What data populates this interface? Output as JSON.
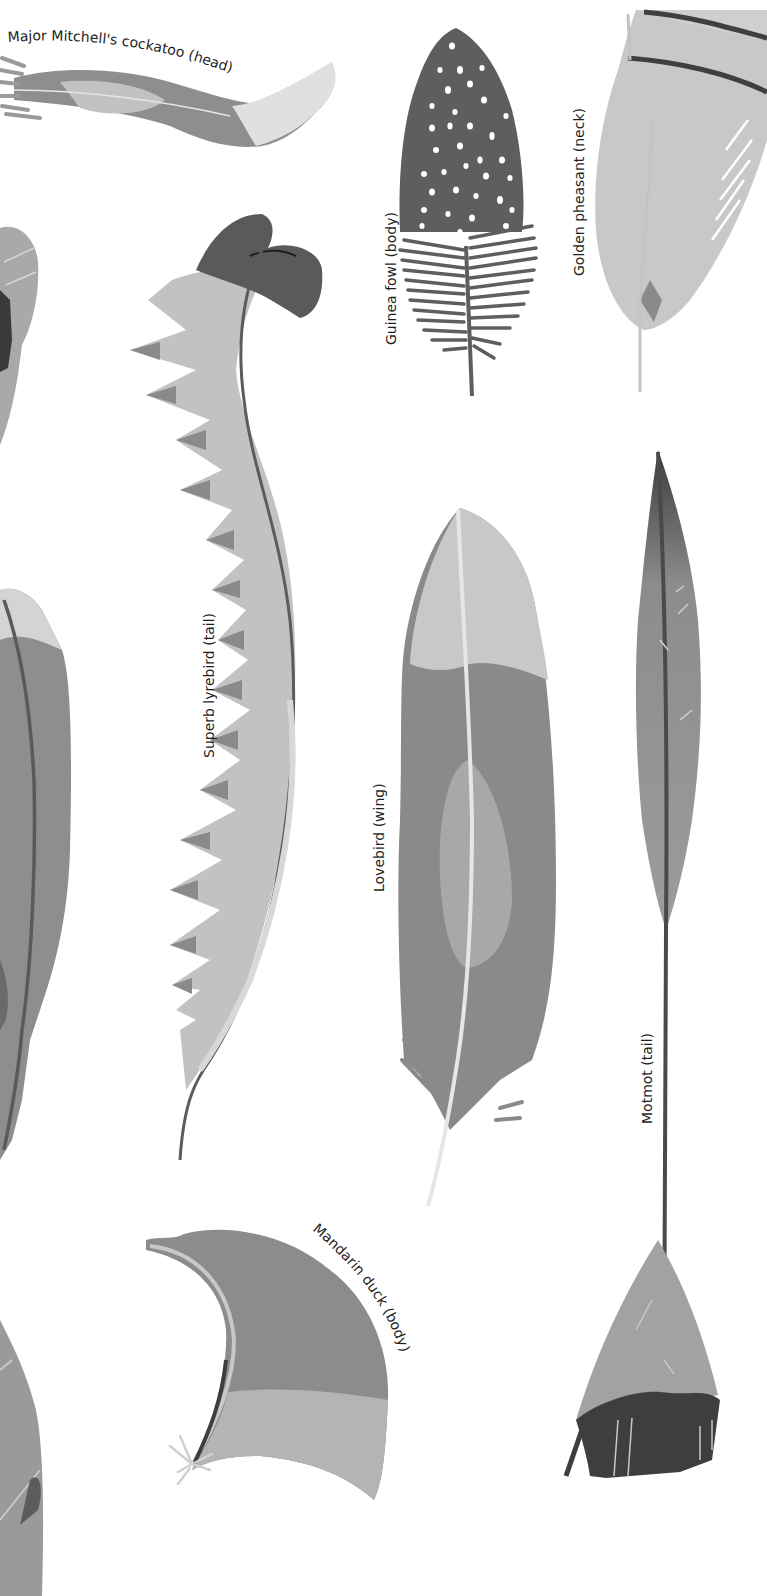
{
  "plate": {
    "background": "#ffffff",
    "palette": {
      "darkest": "#3a3a3a",
      "dark": "#5c5c5c",
      "mid": "#8a8a8a",
      "midlight": "#a9a9a9",
      "light": "#c2c2c2",
      "pale": "#dadada"
    }
  },
  "feathers": [
    {
      "id": "major-mitchells-cockatoo",
      "label": "Major Mitchell's cockatoo (head)"
    },
    {
      "id": "guinea-fowl",
      "label": "Guinea fowl (body)"
    },
    {
      "id": "golden-pheasant",
      "label": "Golden pheasant (neck)"
    },
    {
      "id": "superb-lyrebird",
      "label": "Superb lyrebird (tail)"
    },
    {
      "id": "lovebird",
      "label": "Lovebird (wing)"
    },
    {
      "id": "motmot",
      "label": "Motmot (tail)"
    },
    {
      "id": "mandarin-duck",
      "label": "Mandarin duck (body)"
    }
  ]
}
